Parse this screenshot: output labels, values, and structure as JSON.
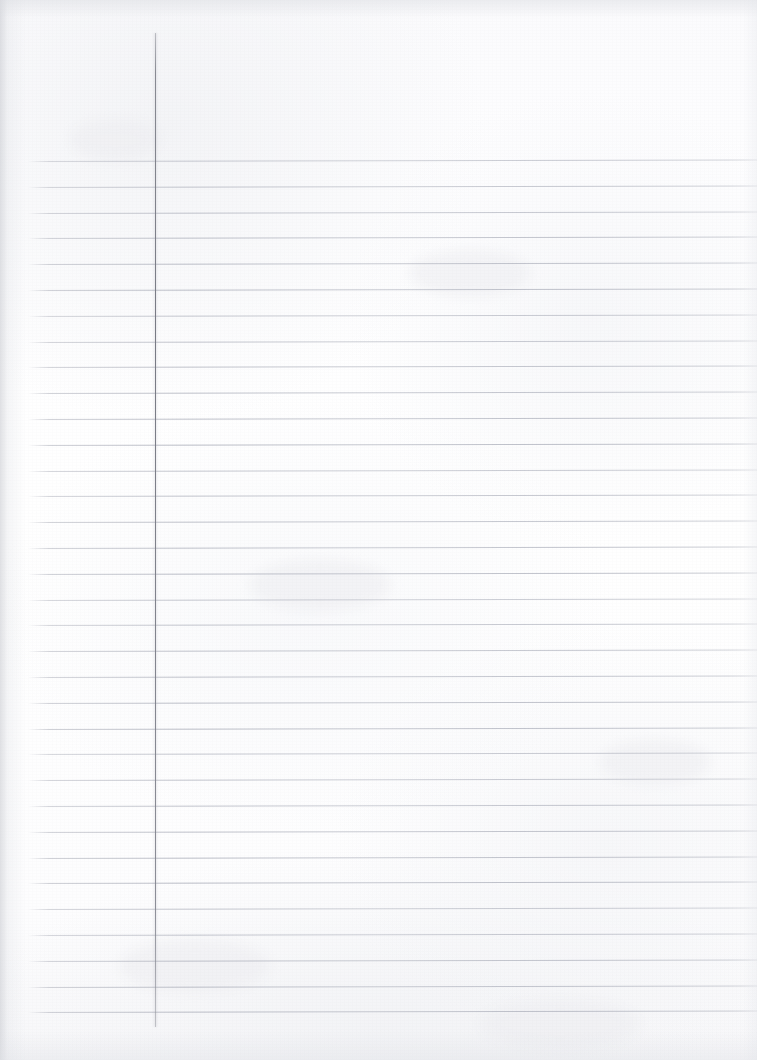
{
  "document": {
    "kind": "scanned-lined-paper",
    "title": "Blank ruled notebook page",
    "page_width": 757,
    "page_height": 1060,
    "content_text": "",
    "handwriting_present": "none"
  },
  "paper": {
    "background_color": "#fdfdfe",
    "grain_opacity": 0.5,
    "edge_shadow_color": "#c6c8ce"
  },
  "margin_rule": {
    "name": "vertical-margin-line",
    "color": "#7a7c86",
    "x": 155,
    "y_start": 33,
    "y_end": 1027,
    "width_px": 1
  },
  "ruled_lines": {
    "name": "horizontal-ruled-lines",
    "color": "#b2b5c0",
    "x_start": 28,
    "x_end": 757,
    "first_y": 161,
    "spacing": 25.8,
    "count": 34,
    "skew_degrees": -0.12,
    "y_positions": [
      161.0,
      186.8,
      212.6,
      238.4,
      264.2,
      290.0,
      315.8,
      341.6,
      367.4,
      393.2,
      419.0,
      444.8,
      470.6,
      496.4,
      522.2,
      548.0,
      573.8,
      599.6,
      625.4,
      651.2,
      677.0,
      702.8,
      728.6,
      754.4,
      780.2,
      806.0,
      831.8,
      857.6,
      883.4,
      909.2,
      935.0,
      960.8,
      986.6,
      1012.4
    ]
  },
  "blotches": [
    {
      "x": 70,
      "y": 120,
      "w": 90,
      "h": 40
    },
    {
      "x": 410,
      "y": 250,
      "w": 120,
      "h": 46
    },
    {
      "x": 250,
      "y": 560,
      "w": 140,
      "h": 50
    },
    {
      "x": 600,
      "y": 740,
      "w": 110,
      "h": 44
    },
    {
      "x": 120,
      "y": 940,
      "w": 150,
      "h": 52
    },
    {
      "x": 480,
      "y": 1000,
      "w": 160,
      "h": 48
    }
  ]
}
